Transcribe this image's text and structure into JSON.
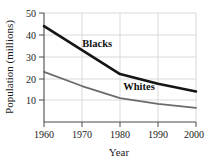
{
  "chart_data": {
    "type": "line",
    "title": "",
    "xlabel": "Year",
    "ylabel": "Population (millions)",
    "x": [
      1960,
      1970,
      1980,
      1990,
      2000
    ],
    "xlim": [
      1960,
      2000
    ],
    "ylim": [
      0,
      50
    ],
    "xticks": [
      "1960",
      "1970",
      "1980",
      "1990",
      "2000"
    ],
    "yticks": [
      "10",
      "20",
      "30",
      "40",
      "50"
    ],
    "ytick_values": [
      10,
      20,
      30,
      40,
      50
    ],
    "grid": true,
    "legend_position": "inline-annotation",
    "series": [
      {
        "name": "Blacks",
        "values": [
          44,
          33,
          22,
          17.5,
          14
        ],
        "color": "#151515",
        "width": 2.6,
        "label_x": 1974,
        "label_y": 34.5
      },
      {
        "name": "Whites",
        "values": [
          23,
          16.5,
          11,
          8.3,
          6.5
        ],
        "color": "#6b6b6b",
        "width": 1.8,
        "label_x": 1985,
        "label_y": 14.5
      }
    ],
    "annotations": [
      {
        "text": "Blacks",
        "series": "Blacks"
      },
      {
        "text": "Whites",
        "series": "Whites"
      }
    ]
  },
  "axes": {
    "x_title": "Year",
    "y_title": "Population (millions)",
    "x_tick_labels": [
      "1960",
      "1970",
      "1980",
      "1990",
      "2000"
    ],
    "y_tick_labels": [
      "50",
      "40",
      "30",
      "20",
      "10"
    ]
  },
  "colors": {
    "background": "#ffffff",
    "axis": "#4a4a4a",
    "grid": "#d9d9d9",
    "series_blacks": "#151515",
    "series_whites": "#6b6b6b",
    "text": "#1a1a1a"
  }
}
